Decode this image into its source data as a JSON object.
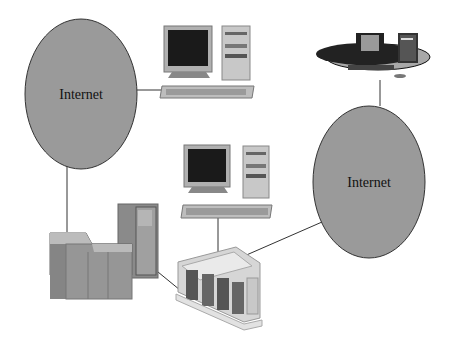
{
  "diagram": {
    "nodes": [
      {
        "id": "internet-left",
        "type": "cloud",
        "label": "Internet"
      },
      {
        "id": "internet-right",
        "type": "cloud",
        "label": "Internet"
      },
      {
        "id": "desktop-top",
        "type": "desktop-computer"
      },
      {
        "id": "desktop-middle",
        "type": "desktop-computer"
      },
      {
        "id": "workstation-platform",
        "type": "workstation"
      },
      {
        "id": "mainframe",
        "type": "mainframe"
      },
      {
        "id": "server-rack",
        "type": "server-rack"
      }
    ],
    "edges": [
      {
        "from": "internet-left",
        "to": "desktop-top"
      },
      {
        "from": "internet-left",
        "to": "mainframe"
      },
      {
        "from": "mainframe",
        "to": "server-rack"
      },
      {
        "from": "desktop-middle",
        "to": "server-rack"
      },
      {
        "from": "server-rack",
        "to": "internet-right"
      },
      {
        "from": "internet-right",
        "to": "workstation-platform"
      }
    ],
    "colors": {
      "cloud_fill": "#9a9a9a",
      "cloud_stroke": "#333333",
      "line": "#333333",
      "monitor_screen": "#1a1a1a",
      "case": "#c8c8c8"
    }
  }
}
